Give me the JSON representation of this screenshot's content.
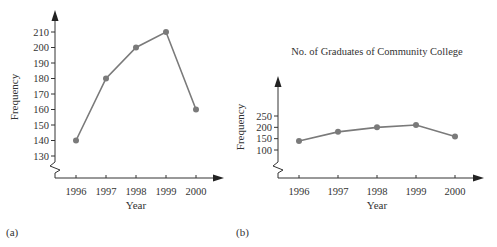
{
  "chart_data": [
    {
      "panel": "(a)",
      "type": "line",
      "title": "",
      "xlabel": "Year",
      "ylabel": "Frequency",
      "categories": [
        "1996",
        "1997",
        "1998",
        "1999",
        "2000"
      ],
      "values": [
        140,
        180,
        200,
        210,
        160
      ],
      "yticks": [
        130,
        140,
        150,
        160,
        170,
        180,
        190,
        200,
        210
      ],
      "ylim": [
        120,
        220
      ],
      "axis_break": true,
      "grid": false
    },
    {
      "panel": "(b)",
      "type": "line",
      "title": "No. of Graduates of Community College",
      "xlabel": "Year",
      "ylabel": "Frequency",
      "categories": [
        "1996",
        "1997",
        "1998",
        "1999",
        "2000"
      ],
      "values": [
        140,
        180,
        200,
        210,
        160
      ],
      "yticks": [
        100,
        150,
        200,
        250
      ],
      "axis_break": true,
      "grid": false
    }
  ],
  "colors": {
    "line": "#7a7a7a",
    "point": "#7a7a7a",
    "axis": "#333333"
  }
}
